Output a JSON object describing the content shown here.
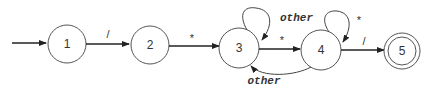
{
  "diagram": {
    "type": "finite-state-automaton",
    "states": [
      {
        "id": "1",
        "label": "1",
        "start": true,
        "accepting": false
      },
      {
        "id": "2",
        "label": "2",
        "start": false,
        "accepting": false
      },
      {
        "id": "3",
        "label": "3",
        "start": false,
        "accepting": false
      },
      {
        "id": "4",
        "label": "4",
        "start": false,
        "accepting": false
      },
      {
        "id": "5",
        "label": "5",
        "start": false,
        "accepting": true
      }
    ],
    "transitions": [
      {
        "from": "1",
        "to": "2",
        "label": "/"
      },
      {
        "from": "2",
        "to": "3",
        "label": "*"
      },
      {
        "from": "3",
        "to": "3",
        "label": "other"
      },
      {
        "from": "3",
        "to": "4",
        "label": "*"
      },
      {
        "from": "4",
        "to": "4",
        "label": "*"
      },
      {
        "from": "4",
        "to": "3",
        "label": "other"
      },
      {
        "from": "4",
        "to": "5",
        "label": "/"
      }
    ]
  }
}
